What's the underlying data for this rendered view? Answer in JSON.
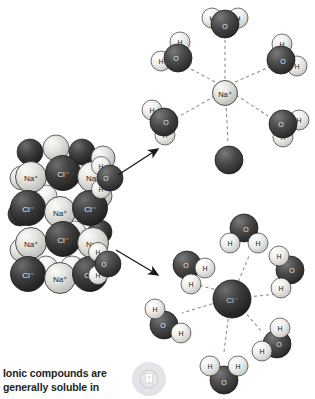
{
  "figure": {
    "background_color": "#ffffff"
  },
  "caption": {
    "line1": "Ionic compounds are",
    "line2": "generally soluble in",
    "color": "#231f20"
  },
  "badge": {
    "icon": "bookmark-badge-icon",
    "circle_color": "#e4e5e8",
    "glyph_color": "#ffffff",
    "ring_color": "#c9cbce"
  },
  "colors": {
    "sodium_ion": "#d8d8d6",
    "chloride_ion": "#3b3b3b",
    "oxygen": "#4a4a4a",
    "hydrogen": "#e8e8e6",
    "outline": "#2a2a2a",
    "dashed_bond": "#8c8c8c",
    "arrow": "#1a1a1a"
  },
  "crystal": {
    "label": "NaCl crystal lattice",
    "cation_label": "Na⁺",
    "anion_label": "Cl⁻",
    "rows": [
      [
        "Na⁺",
        "Cl⁻",
        "Na⁺"
      ],
      [
        "Cl⁻",
        "Na⁺",
        "Cl⁻"
      ],
      [
        "Na⁺",
        "Cl⁻",
        "Na⁺"
      ],
      [
        "Cl⁻",
        "Na⁺",
        "Cl⁻"
      ]
    ],
    "attached_waters": 2
  },
  "arrows": [
    {
      "name": "arrow-to-sodium-shell",
      "direction": "up-right"
    },
    {
      "name": "arrow-to-chloride-shell",
      "direction": "down-right"
    }
  ],
  "hydration_shells": [
    {
      "name": "sodium-hydration-shell",
      "center_ion": "Na⁺",
      "ion_type": "cation",
      "water_count": 6,
      "water_orientation": "oxygen-toward-ion",
      "atom_labels": {
        "oxygen": "O",
        "hydrogen": "H"
      }
    },
    {
      "name": "chloride-hydration-shell",
      "center_ion": "Cl⁻",
      "ion_type": "anion",
      "water_count": 6,
      "water_orientation": "hydrogen-toward-ion",
      "atom_labels": {
        "oxygen": "O",
        "hydrogen": "H"
      }
    }
  ]
}
